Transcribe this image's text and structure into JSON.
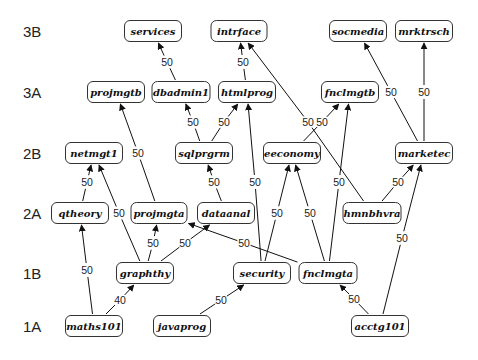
{
  "diagram": {
    "type": "course-prerequisite-graph",
    "row_labels": [
      {
        "id": "3B",
        "label": "3B",
        "y": 31
      },
      {
        "id": "3A",
        "label": "3A",
        "y": 92
      },
      {
        "id": "2B",
        "label": "2B",
        "y": 153
      },
      {
        "id": "2A",
        "label": "2A",
        "y": 213
      },
      {
        "id": "1B",
        "label": "1B",
        "y": 273
      },
      {
        "id": "1A",
        "label": "1A",
        "y": 326
      }
    ],
    "nodes": [
      {
        "id": "services",
        "label": "services",
        "x": 153,
        "y": 31,
        "w": 58
      },
      {
        "id": "intrface",
        "label": "intrface",
        "x": 239,
        "y": 31,
        "w": 57
      },
      {
        "id": "socmedia",
        "label": "socmedia",
        "x": 358,
        "y": 31,
        "w": 58
      },
      {
        "id": "mrktrsch",
        "label": "mrktrsch",
        "x": 424,
        "y": 31,
        "w": 58
      },
      {
        "id": "projmgtb",
        "label": "projmgtb",
        "x": 116,
        "y": 92,
        "w": 58
      },
      {
        "id": "dbadmin1",
        "label": "dbadmin1",
        "x": 181,
        "y": 92,
        "w": 59
      },
      {
        "id": "htmlprog",
        "label": "htmlprog",
        "x": 247,
        "y": 92,
        "w": 58
      },
      {
        "id": "fnclmgtb",
        "label": "fnclmgtb",
        "x": 350,
        "y": 92,
        "w": 58
      },
      {
        "id": "netmgt1",
        "label": "netmgt1",
        "x": 94,
        "y": 153,
        "w": 58
      },
      {
        "id": "sqlprgrm",
        "label": "sqlprgrm",
        "x": 204,
        "y": 153,
        "w": 58
      },
      {
        "id": "eeconomy",
        "label": "eeconomy",
        "x": 292,
        "y": 153,
        "w": 58
      },
      {
        "id": "marketec",
        "label": "marketec",
        "x": 424,
        "y": 153,
        "w": 58
      },
      {
        "id": "qtheory",
        "label": "qtheory",
        "x": 80,
        "y": 213,
        "w": 58
      },
      {
        "id": "projmgta",
        "label": "projmgta",
        "x": 159,
        "y": 213,
        "w": 57
      },
      {
        "id": "dataanal",
        "label": "dataanal",
        "x": 226,
        "y": 213,
        "w": 58
      },
      {
        "id": "hmnbhvra",
        "label": "hmnbhvra",
        "x": 372,
        "y": 213,
        "w": 59
      },
      {
        "id": "graphthy",
        "label": "graphthy",
        "x": 145,
        "y": 273,
        "w": 58
      },
      {
        "id": "security",
        "label": "security",
        "x": 262,
        "y": 273,
        "w": 58
      },
      {
        "id": "fnclmgta",
        "label": "fnclmgta",
        "x": 328,
        "y": 273,
        "w": 59
      },
      {
        "id": "maths101",
        "label": "maths101",
        "x": 94,
        "y": 326,
        "w": 58
      },
      {
        "id": "javaprog",
        "label": "javaprog",
        "x": 182,
        "y": 326,
        "w": 58
      },
      {
        "id": "acctg101",
        "label": "acctg101",
        "x": 380,
        "y": 326,
        "w": 58
      }
    ],
    "edges": [
      {
        "from": "dbadmin1",
        "to": "services",
        "weight": "50",
        "label_x": 167,
        "label_y": 62
      },
      {
        "from": "htmlprog",
        "to": "intrface",
        "weight": "50",
        "label_x": 243,
        "label_y": 62
      },
      {
        "from": "hmnbhvra",
        "to": "intrface",
        "weight": "50",
        "label_x": 308,
        "label_y": 122
      },
      {
        "from": "marketec",
        "to": "socmedia",
        "weight": "50",
        "label_x": 391,
        "label_y": 92
      },
      {
        "from": "marketec",
        "to": "mrktrsch",
        "weight": "50",
        "label_x": 424,
        "label_y": 92
      },
      {
        "from": "projmgta",
        "to": "projmgtb",
        "weight": "50",
        "label_x": 138,
        "label_y": 153
      },
      {
        "from": "sqlprgrm",
        "to": "dbadmin1",
        "weight": "50",
        "label_x": 193,
        "label_y": 122
      },
      {
        "from": "sqlprgrm",
        "to": "htmlprog",
        "weight": "50",
        "label_x": 224,
        "label_y": 122
      },
      {
        "from": "security",
        "to": "htmlprog",
        "weight": "50",
        "label_x": 255,
        "label_y": 182
      },
      {
        "from": "eeconomy",
        "to": "fnclmgtb",
        "weight": "50",
        "label_x": 322,
        "label_y": 122
      },
      {
        "from": "fnclmgta",
        "to": "fnclmgtb",
        "weight": "50",
        "label_x": 339,
        "label_y": 182
      },
      {
        "from": "qtheory",
        "to": "netmgt1",
        "weight": "50",
        "label_x": 87,
        "label_y": 182
      },
      {
        "from": "graphthy",
        "to": "netmgt1",
        "weight": "50",
        "label_x": 119,
        "label_y": 213
      },
      {
        "from": "dataanal",
        "to": "sqlprgrm",
        "weight": "50",
        "label_x": 214,
        "label_y": 182
      },
      {
        "from": "security",
        "to": "eeconomy",
        "weight": "50",
        "label_x": 277,
        "label_y": 213
      },
      {
        "from": "fnclmgta",
        "to": "eeconomy",
        "weight": "50",
        "label_x": 310,
        "label_y": 213
      },
      {
        "from": "hmnbhvra",
        "to": "marketec",
        "weight": "50",
        "label_x": 398,
        "label_y": 182
      },
      {
        "from": "acctg101",
        "to": "marketec",
        "weight": "50",
        "label_x": 402,
        "label_y": 238
      },
      {
        "from": "maths101",
        "to": "qtheory",
        "weight": "50",
        "label_x": 87,
        "label_y": 270
      },
      {
        "from": "graphthy",
        "to": "projmgta",
        "weight": "50",
        "label_x": 153,
        "label_y": 243
      },
      {
        "from": "graphthy",
        "to": "dataanal",
        "weight": "50",
        "label_x": 185,
        "label_y": 243
      },
      {
        "from": "fnclmgta",
        "to": "projmgta",
        "weight": "50",
        "label_x": 244,
        "label_y": 243
      },
      {
        "from": "maths101",
        "to": "graphthy",
        "weight": "40",
        "label_x": 120,
        "label_y": 300
      },
      {
        "from": "javaprog",
        "to": "security",
        "weight": "50",
        "label_x": 221,
        "label_y": 300
      },
      {
        "from": "acctg101",
        "to": "fnclmgta",
        "weight": "50",
        "label_x": 354,
        "label_y": 299
      }
    ]
  }
}
